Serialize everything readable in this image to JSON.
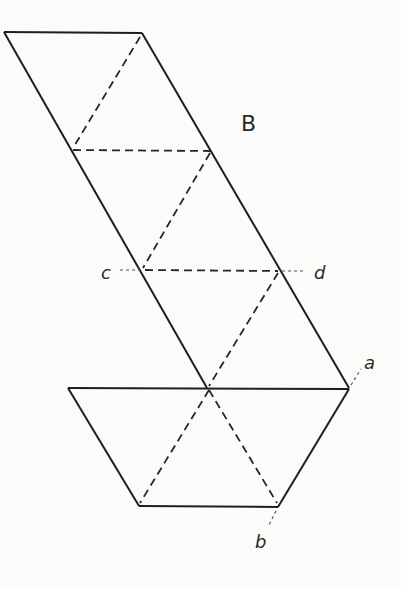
{
  "diagram": {
    "type": "net",
    "labels": {
      "region": "B",
      "c": "c",
      "d": "d",
      "a": "a",
      "b": "b"
    },
    "colors": {
      "line": "#1e1e1e",
      "background": "#fbfbf9"
    }
  }
}
